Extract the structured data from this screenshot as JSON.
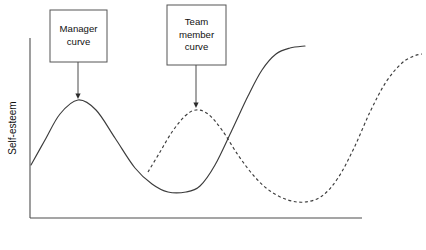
{
  "figure": {
    "background_color": "#ffffff",
    "line_color": "#3c3c3c",
    "axis_color": "#4d4d4d",
    "box_border_color": "#555555"
  },
  "axes": {
    "y_label": "Self-esteem",
    "x_label": "",
    "y_axis_x": 30,
    "y_axis_top": 38,
    "y_axis_bottom": 218,
    "x_axis_y": 218,
    "x_axis_left": 30,
    "x_axis_right": 362
  },
  "callouts": [
    {
      "id": "manager-curve-callout",
      "lines": [
        "Manager",
        "curve"
      ],
      "box": {
        "x": 50,
        "y": 10,
        "width": 57,
        "height": 52
      },
      "leader": {
        "x": 78,
        "y_start": 62,
        "y_end": 99
      },
      "target_curve": "manager"
    },
    {
      "id": "team-member-curve-callout",
      "lines": [
        "Team",
        "member",
        "curve"
      ],
      "box": {
        "x": 167,
        "y": 5,
        "width": 59,
        "height": 60
      },
      "leader": {
        "x": 196,
        "y_start": 65,
        "y_end": 108
      },
      "target_curve": "team-member"
    }
  ],
  "chart_data": {
    "type": "line",
    "title": "",
    "xlabel": "",
    "ylabel": "Self-esteem",
    "grid": false,
    "legend_position": "annotation-callouts",
    "axis_ranges": {
      "x_pixels": [
        30,
        362
      ],
      "y_pixels": [
        218,
        38
      ]
    },
    "series": [
      {
        "name": "Manager curve",
        "style": "solid",
        "description": "Rises from mid-low start to an early peak, falls to a deep trough, then rises steeply to a high plateau.",
        "points": [
          {
            "x": 31,
            "y": 165
          },
          {
            "x": 45,
            "y": 140
          },
          {
            "x": 60,
            "y": 114
          },
          {
            "x": 78,
            "y": 100
          },
          {
            "x": 96,
            "y": 110
          },
          {
            "x": 115,
            "y": 138
          },
          {
            "x": 135,
            "y": 168
          },
          {
            "x": 152,
            "y": 184
          },
          {
            "x": 168,
            "y": 192
          },
          {
            "x": 186,
            "y": 192
          },
          {
            "x": 200,
            "y": 186
          },
          {
            "x": 215,
            "y": 165
          },
          {
            "x": 232,
            "y": 130
          },
          {
            "x": 248,
            "y": 96
          },
          {
            "x": 262,
            "y": 70
          },
          {
            "x": 276,
            "y": 54
          },
          {
            "x": 290,
            "y": 48
          },
          {
            "x": 305,
            "y": 46
          }
        ]
      },
      {
        "name": "Team member curve",
        "style": "dashed",
        "description": "Starts mid-way along the axis, rises to a peak, falls to a late trough, then rises steeply at the far right.",
        "points": [
          {
            "x": 148,
            "y": 172
          },
          {
            "x": 160,
            "y": 152
          },
          {
            "x": 172,
            "y": 132
          },
          {
            "x": 185,
            "y": 116
          },
          {
            "x": 196,
            "y": 110
          },
          {
            "x": 208,
            "y": 114
          },
          {
            "x": 222,
            "y": 130
          },
          {
            "x": 238,
            "y": 155
          },
          {
            "x": 254,
            "y": 176
          },
          {
            "x": 270,
            "y": 191
          },
          {
            "x": 288,
            "y": 200
          },
          {
            "x": 305,
            "y": 202
          },
          {
            "x": 322,
            "y": 196
          },
          {
            "x": 338,
            "y": 178
          },
          {
            "x": 354,
            "y": 148
          },
          {
            "x": 370,
            "y": 112
          },
          {
            "x": 386,
            "y": 82
          },
          {
            "x": 402,
            "y": 63
          },
          {
            "x": 414,
            "y": 56
          },
          {
            "x": 422,
            "y": 54
          }
        ]
      }
    ]
  }
}
